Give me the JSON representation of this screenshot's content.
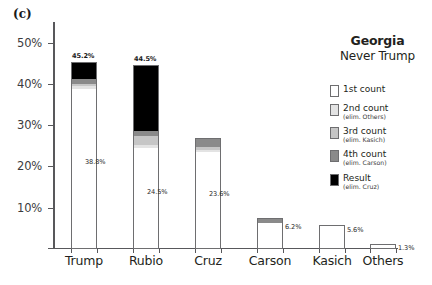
{
  "panel": {
    "label": "(c)"
  },
  "legend": {
    "title": "Georgia",
    "subtitle": "Never Trump",
    "items": [
      {
        "name": "1st count",
        "note": "",
        "color": "#ffffff"
      },
      {
        "name": "2nd count",
        "note": "(elim. Others)",
        "color": "#e3e3e3"
      },
      {
        "name": "3rd count",
        "note": "(elim. Kasich)",
        "color": "#c6c6c6"
      },
      {
        "name": "4th count",
        "note": "(elim. Carson)",
        "color": "#8a8a8a"
      },
      {
        "name": "Result",
        "note": "(elim. Cruz)",
        "color": "#000000"
      }
    ]
  },
  "axes": {
    "y_ticks": [
      "10%",
      "20%",
      "30%",
      "40%",
      "50%"
    ],
    "y_values": [
      10,
      20,
      30,
      40,
      50
    ],
    "y_min": 0,
    "y_max": 55
  },
  "chart_data": {
    "type": "bar",
    "xlabel": "",
    "ylabel": "",
    "ylim": [
      0,
      55
    ],
    "grid": false,
    "legend_position": "right",
    "stacked": "cumulative-rounds",
    "categories": [
      "Trump",
      "Rubio",
      "Cruz",
      "Carson",
      "Kasich",
      "Others"
    ],
    "series": [
      {
        "name": "1st count",
        "note": "",
        "color": "#ffffff",
        "values": [
          38.8,
          24.5,
          23.6,
          6.2,
          5.6,
          1.3
        ]
      },
      {
        "name": "2nd count",
        "note": "(elim. Others)",
        "color": "#e3e3e3",
        "values": [
          39.4,
          25.1,
          23.9,
          6.3,
          5.7,
          null
        ]
      },
      {
        "name": "3rd count",
        "note": "(elim. Kasich)",
        "color": "#c6c6c6",
        "values": [
          40.1,
          27.4,
          24.6,
          6.4,
          null,
          null
        ]
      },
      {
        "name": "4th count",
        "note": "(elim. Carson)",
        "color": "#8a8a8a",
        "values": [
          41.2,
          28.6,
          27.0,
          null,
          null,
          null
        ]
      },
      {
        "name": "Result",
        "note": "(elim. Cruz)",
        "color": "#000000",
        "values": [
          45.2,
          44.5,
          null,
          null,
          null,
          null
        ]
      }
    ],
    "data_labels": {
      "top": [
        "45.2%",
        "44.5%",
        null,
        null,
        null,
        null
      ],
      "first": [
        "38.8%",
        "24.5%",
        "23.6%",
        "6.2%",
        "5.6%",
        "1.3%"
      ]
    }
  },
  "bars": [
    {
      "category": "Trump",
      "top_label": "45.2%",
      "first_label": "38.8%",
      "segments": [
        {
          "series": "1st count",
          "from": 0,
          "to": 38.8,
          "color": "#ffffff"
        },
        {
          "series": "2nd count",
          "from": 38.8,
          "to": 39.4,
          "color": "#e3e3e3"
        },
        {
          "series": "3rd count",
          "from": 39.4,
          "to": 40.1,
          "color": "#c6c6c6"
        },
        {
          "series": "4th count",
          "from": 40.1,
          "to": 41.2,
          "color": "#8a8a8a"
        },
        {
          "series": "Result",
          "from": 41.2,
          "to": 45.2,
          "color": "#000000"
        }
      ]
    },
    {
      "category": "Rubio",
      "top_label": "44.5%",
      "first_label": "24.5%",
      "segments": [
        {
          "series": "1st count",
          "from": 0,
          "to": 24.5,
          "color": "#ffffff"
        },
        {
          "series": "2nd count",
          "from": 24.5,
          "to": 25.1,
          "color": "#e3e3e3"
        },
        {
          "series": "3rd count",
          "from": 25.1,
          "to": 27.4,
          "color": "#c6c6c6"
        },
        {
          "series": "4th count",
          "from": 27.4,
          "to": 28.6,
          "color": "#8a8a8a"
        },
        {
          "series": "Result",
          "from": 28.6,
          "to": 44.5,
          "color": "#000000"
        }
      ]
    },
    {
      "category": "Cruz",
      "top_label": "",
      "first_label": "23.6%",
      "segments": [
        {
          "series": "1st count",
          "from": 0,
          "to": 23.6,
          "color": "#ffffff"
        },
        {
          "series": "2nd count",
          "from": 23.6,
          "to": 23.9,
          "color": "#e3e3e3"
        },
        {
          "series": "3rd count",
          "from": 23.9,
          "to": 24.6,
          "color": "#c6c6c6"
        },
        {
          "series": "4th count",
          "from": 24.6,
          "to": 27.0,
          "color": "#8a8a8a"
        }
      ]
    },
    {
      "category": "Carson",
      "top_label": "",
      "first_label": "6.2%",
      "segments": [
        {
          "series": "1st count",
          "from": 0,
          "to": 6.2,
          "color": "#ffffff"
        },
        {
          "series": "2nd count",
          "from": 6.2,
          "to": 6.3,
          "color": "#e3e3e3"
        },
        {
          "series": "3rd count",
          "from": 6.3,
          "to": 7.4,
          "color": "#8a8a8a"
        }
      ]
    },
    {
      "category": "Kasich",
      "top_label": "",
      "first_label": "5.6%",
      "segments": [
        {
          "series": "1st count",
          "from": 0,
          "to": 5.6,
          "color": "#ffffff"
        },
        {
          "series": "2nd count",
          "from": 5.6,
          "to": 5.9,
          "color": "#e3e3e3"
        }
      ]
    },
    {
      "category": "Others",
      "top_label": "",
      "first_label": "1.3%",
      "segments": [
        {
          "series": "1st count",
          "from": 0,
          "to": 1.3,
          "color": "#ffffff"
        }
      ]
    }
  ]
}
